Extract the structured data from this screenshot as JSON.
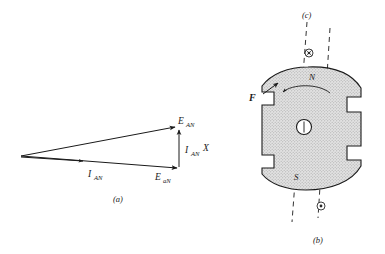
{
  "figure": {
    "background_color": "#ffffff",
    "ink_color": "#1a1a1a",
    "hatch_fill_color": "#d9d9d9",
    "panels": [
      {
        "id": "a",
        "label": "(a)",
        "kind": "phasor-diagram"
      },
      {
        "id": "b",
        "label": "(b)",
        "kind": "rotor-cross-section"
      },
      {
        "id": "c",
        "label": "(c)",
        "kind": "axis-reference"
      }
    ]
  },
  "phasor_diagram": {
    "panel_label": "(a)",
    "vectors": [
      {
        "name": "E_AN",
        "base": "E",
        "subscript": "AN",
        "description": "upper resultant phasor from origin to apex"
      },
      {
        "name": "E_aN",
        "base": "E",
        "subscript": "aN",
        "description": "lower phasor from origin to lower right vertex"
      },
      {
        "name": "I_AN",
        "base": "I",
        "subscript": "AN",
        "description": "short current phasor along the lower direction"
      },
      {
        "name": "I_AN X",
        "base": "I",
        "subscript": "AN",
        "suffix": "X",
        "description": "vertical reactance drop closing the triangle"
      }
    ],
    "labels": {
      "e_an_base": "E",
      "e_an_sub": "AN",
      "e_a_n_base": "E",
      "e_a_n_sub": "aN",
      "i_an_base": "I",
      "i_an_sub": "AN",
      "i_an_x_base": "I",
      "i_an_x_sub": "AN",
      "i_an_x_suffix": "X"
    }
  },
  "rotor_diagram": {
    "panel_label_bottom": "(b)",
    "panel_label_top": "(c)",
    "pole_north": "N",
    "pole_south": "S",
    "force_label": "F",
    "shaft_label": "",
    "symbols": {
      "top_marker": "circled-cross-dot",
      "bottom_marker": "circled-dot"
    },
    "rotation_arrow": "counterclockwise-curved-arrow",
    "notes": {
      "axis_c": "dashed magnetic axis through (c) marker",
      "axis_b": "dashed magnetic axis through (b) marker",
      "force_direction": "up-and-to-the-left"
    }
  }
}
